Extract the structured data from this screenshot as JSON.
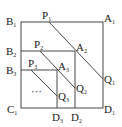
{
  "diagram": {
    "title": "",
    "labels": {
      "B1": {
        "letter": "B",
        "sub": "1"
      },
      "A1": {
        "letter": "A",
        "sub": "1"
      },
      "P1": {
        "letter": "P",
        "sub": "1"
      },
      "B2": {
        "letter": "B",
        "sub": "2"
      },
      "P2": {
        "letter": "P",
        "sub": "2"
      },
      "A2": {
        "letter": "A",
        "sub": "2"
      },
      "B3": {
        "letter": "B",
        "sub": "3"
      },
      "P3": {
        "letter": "P",
        "sub": "3"
      },
      "A3": {
        "letter": "A",
        "sub": "3"
      },
      "Q1": {
        "letter": "Q",
        "sub": "1"
      },
      "Q2": {
        "letter": "Q",
        "sub": "2"
      },
      "Q3": {
        "letter": "Q",
        "sub": "3"
      },
      "C1": {
        "letter": "C",
        "sub": "1"
      },
      "D3": {
        "letter": "D",
        "sub": "3"
      },
      "D2": {
        "letter": "D",
        "sub": "2"
      },
      "D1": {
        "letter": "D",
        "sub": "1"
      }
    },
    "ellipsis": "···",
    "colors": {
      "line": "#333333",
      "text": "#222222",
      "background": "#ffffff"
    }
  }
}
